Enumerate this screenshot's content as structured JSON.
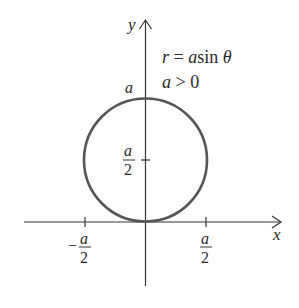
{
  "figure": {
    "equation": "r = a sin θ",
    "equation_parts": {
      "r": "r",
      "eq": " = ",
      "a": "a",
      "sin": "sin ",
      "theta": "θ"
    },
    "condition_parts": {
      "a": "a",
      "rest": " > 0"
    },
    "axis_x_label": "x",
    "axis_y_label": "y",
    "top_label": "a",
    "mid_label_num": "a",
    "mid_label_den": "2",
    "left_tick_sign": "−",
    "left_tick_num": "a",
    "left_tick_den": "2",
    "right_tick_num": "a",
    "right_tick_den": "2",
    "curve_color": "#555555",
    "axis_color": "#333333"
  }
}
